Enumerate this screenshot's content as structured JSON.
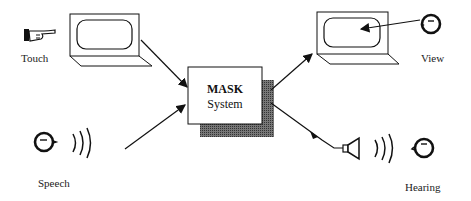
{
  "diagram": {
    "center": {
      "title": "MASK",
      "subtitle": "System"
    },
    "inputs": [
      {
        "label": "Touch",
        "icon": "pointing-hand-icon"
      },
      {
        "label": "Speech",
        "icon": "speaking-head-icon"
      }
    ],
    "outputs": [
      {
        "label": "View",
        "icon": "eye-head-icon"
      },
      {
        "label": "Hearing",
        "icon": "listening-head-icon"
      }
    ],
    "colors": {
      "stroke": "#111111",
      "shadow": "#555555",
      "background": "#ffffff"
    }
  }
}
